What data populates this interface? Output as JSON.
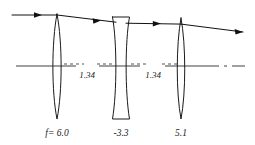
{
  "figure": {
    "type": "optical-ray-diagram",
    "background_color": "#ffffff",
    "ink_color": "#1a1a1a",
    "axis_color": "#2a2a2a"
  },
  "labels": {
    "lens1_focal": "f= 6.0",
    "lens2_focal": "-3.3",
    "lens3_focal": "5.1",
    "gap1": "1.34",
    "gap2": "1.34"
  },
  "elements": [
    {
      "name": "lens-1",
      "kind": "biconvex",
      "power": "positive",
      "focal_label": "f= 6.0",
      "center_x": 57,
      "top_y": 14,
      "bottom_y": 119,
      "half_thickness": 4.2
    },
    {
      "name": "lens-2",
      "kind": "biconcave",
      "power": "negative",
      "focal_label": "-3.3",
      "center_x": 121,
      "top_y": 17,
      "bottom_y": 119,
      "edge_half_width": 8.5,
      "waist_half_width": 2.6
    },
    {
      "name": "lens-3",
      "kind": "biconvex",
      "power": "positive",
      "focal_label": "5.1",
      "center_x": 181,
      "top_y": 18,
      "bottom_y": 119,
      "half_thickness": 3.8
    }
  ],
  "optical_axis": {
    "name": "optical-axis",
    "y": 66,
    "x_start": 16,
    "x_end": 245,
    "style": "solid with dash-dot break at right"
  },
  "ray": {
    "name": "traced-ray",
    "description": "single marginal ray entering parallel to axis, refracted by three elements",
    "points": [
      {
        "x": 12,
        "y": 15
      },
      {
        "x": 57,
        "y": 15
      },
      {
        "x": 121,
        "y": 23
      },
      {
        "x": 181,
        "y": 24
      },
      {
        "x": 243,
        "y": 32
      }
    ],
    "arrow_positions": [
      {
        "x": 40,
        "y": 15,
        "angle_deg": 0
      },
      {
        "x": 100,
        "y": 21,
        "angle_deg": 7
      },
      {
        "x": 160,
        "y": 23.5,
        "angle_deg": 1
      },
      {
        "x": 238,
        "y": 31.4,
        "angle_deg": 8
      }
    ]
  },
  "dimensions": [
    {
      "name": "gap-1-34-first",
      "label": "1.34",
      "from_x": 61,
      "to_x": 113,
      "y": 66,
      "label_x": 87,
      "label_y": 77
    },
    {
      "name": "gap-1-34-second",
      "label": "1.34",
      "from_x": 130,
      "to_x": 176,
      "y": 66,
      "label_x": 153,
      "label_y": 77
    }
  ],
  "focal_label_positions": [
    {
      "name": "lens1-focal-label",
      "text": "f= 6.0",
      "x": 57,
      "y": 135
    },
    {
      "name": "lens2-focal-label",
      "text": "-3.3",
      "x": 121,
      "y": 135
    },
    {
      "name": "lens3-focal-label",
      "text": "5.1",
      "x": 181,
      "y": 135
    }
  ]
}
